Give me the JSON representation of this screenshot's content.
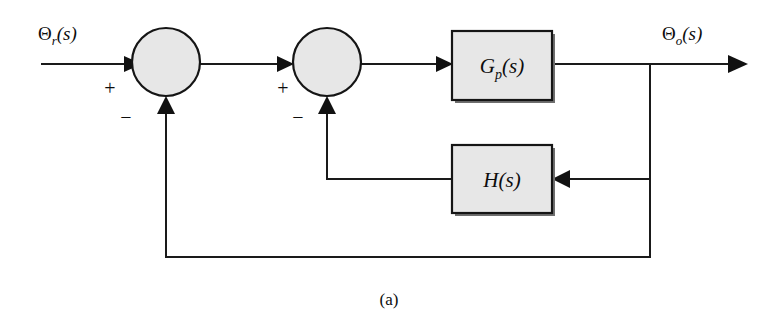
{
  "figure": {
    "caption": "(a)",
    "background_color": "#ffffff",
    "line_color": "#1a1a1a",
    "shape_fill_color": "#e7e7e7"
  },
  "signals": {
    "input": {
      "symbol": "Θ",
      "subscript": "r",
      "argument": "(s)",
      "full_label": "Θr(s)"
    },
    "output": {
      "symbol": "Θ",
      "subscript": "o",
      "argument": "(s)",
      "full_label": "Θo(s)"
    }
  },
  "summing_junctions": [
    {
      "id": "outer-sum",
      "positive_sign": "+",
      "negative_sign": "−",
      "cx": 166,
      "cy": 62,
      "r": 34
    },
    {
      "id": "inner-sum",
      "positive_sign": "+",
      "negative_sign": "−",
      "cx": 327,
      "cy": 62,
      "r": 34
    }
  ],
  "blocks": [
    {
      "id": "plant",
      "name": "G",
      "subscript": "p",
      "argument": "(s)",
      "full_label": "Gp(s)",
      "x": 452,
      "y": 31,
      "width": 100,
      "height": 69
    },
    {
      "id": "feedback",
      "name": "H",
      "subscript": "",
      "argument": "(s)",
      "full_label": "H(s)",
      "x": 452,
      "y": 145,
      "width": 100,
      "height": 68
    }
  ],
  "connections": [
    {
      "id": "input-to-outer-sum",
      "from": "input",
      "to": "outer-sum",
      "direction": "right"
    },
    {
      "id": "outer-sum-to-inner-sum",
      "from": "outer-sum",
      "to": "inner-sum",
      "direction": "right"
    },
    {
      "id": "inner-sum-to-plant",
      "from": "inner-sum",
      "to": "plant",
      "direction": "right"
    },
    {
      "id": "plant-to-output",
      "from": "plant",
      "to": "output",
      "direction": "right"
    },
    {
      "id": "output-branch-to-feedback",
      "from": "output-branch",
      "to": "feedback",
      "direction": "left"
    },
    {
      "id": "feedback-to-inner-sum",
      "from": "feedback",
      "to": "inner-sum",
      "direction": "up"
    },
    {
      "id": "output-branch-to-outer-sum",
      "from": "output-branch",
      "to": "outer-sum",
      "direction": "up"
    }
  ]
}
